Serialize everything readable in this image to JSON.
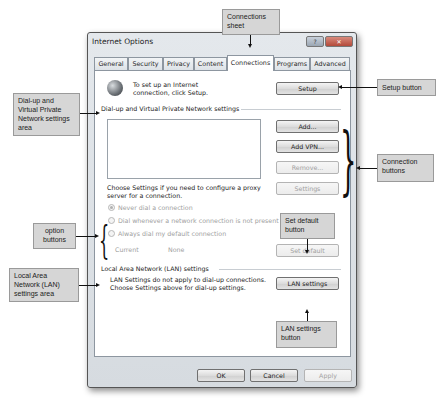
{
  "dialog": {
    "title": "Internet Options",
    "help_button": "?",
    "close_button": "✕",
    "tabs": [
      {
        "label": "General",
        "active": false
      },
      {
        "label": "Security",
        "active": false
      },
      {
        "label": "Privacy",
        "active": false
      },
      {
        "label": "Content",
        "active": false
      },
      {
        "label": "Connections",
        "active": true
      },
      {
        "label": "Programs",
        "active": false
      },
      {
        "label": "Advanced",
        "active": false
      }
    ],
    "setup": {
      "icon": "globe-network-icon",
      "text": "To set up an Internet connection, click Setup.",
      "button": "Setup"
    },
    "dialup": {
      "group_label": "Dial-up and Virtual Private Network settings",
      "buttons": {
        "add": "Add...",
        "add_vpn": "Add VPN...",
        "remove": "Remove...",
        "settings": "Settings"
      },
      "proxy_text": "Choose Settings if you need to configure a proxy server for a connection.",
      "options": [
        {
          "label": "Never dial a connection",
          "checked": true
        },
        {
          "label": "Dial whenever a network connection is not present",
          "checked": false
        },
        {
          "label": "Always dial my default connection",
          "checked": false
        }
      ],
      "current_label": "Current",
      "current_value": "None",
      "set_default_button": "Set default"
    },
    "lan": {
      "group_label": "Local Area Network (LAN) settings",
      "text": "LAN Settings do not apply to dial-up connections. Choose Settings above for dial-up settings.",
      "button": "LAN settings"
    },
    "footer": {
      "ok": "OK",
      "cancel": "Cancel",
      "apply": "Apply"
    }
  },
  "callouts": {
    "connections_sheet": "Connections sheet",
    "setup_button": "Setup button",
    "dialup_area": "Dial-up and Virtual Private Network settings area",
    "connection_buttons": "Connection buttons",
    "option_buttons": "option buttons",
    "set_default_button": "Set default button",
    "lan_area": "Local Area Network (LAN) settings area",
    "lan_settings_button": "LAN settings button"
  }
}
